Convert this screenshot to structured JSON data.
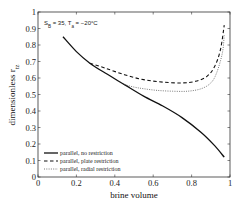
{
  "chart_data": {
    "type": "line",
    "title": "",
    "annotation": "S_B = 35, T_a = -20°C",
    "annotation_parts": {
      "s": "S",
      "s_sub": "B",
      "s_val": " = 35, T",
      "t_sub": "a",
      "t_val": " = −20°C"
    },
    "xlabel": "brine volume",
    "ylabel": "dimensionless r_tz",
    "ylabel_main": "dimensionless r",
    "ylabel_sub": "tz",
    "xlim": [
      0,
      1
    ],
    "ylim": [
      0,
      1
    ],
    "xticks": [
      "0",
      "0.2",
      "0.4",
      "0.6",
      "0.8",
      "1"
    ],
    "yticks": [
      "0",
      "0.1",
      "0.2",
      "0.3",
      "0.4",
      "0.5",
      "0.6",
      "0.7",
      "0.8",
      "0.9",
      "1"
    ],
    "grid": false,
    "legend_position": "lower left",
    "series": [
      {
        "name": "parallel, no restriction",
        "style": "solid",
        "x": [
          0.13,
          0.2,
          0.27,
          0.35,
          0.45,
          0.55,
          0.65,
          0.75,
          0.85,
          0.92,
          0.97
        ],
        "y": [
          0.85,
          0.76,
          0.69,
          0.63,
          0.56,
          0.49,
          0.43,
          0.36,
          0.27,
          0.19,
          0.12
        ]
      },
      {
        "name": "parallel, plate restriction",
        "style": "dashed",
        "x": [
          0.27,
          0.35,
          0.45,
          0.55,
          0.65,
          0.75,
          0.82,
          0.88,
          0.92,
          0.95,
          0.97
        ],
        "y": [
          0.69,
          0.66,
          0.62,
          0.59,
          0.575,
          0.57,
          0.58,
          0.61,
          0.67,
          0.77,
          0.92
        ]
      },
      {
        "name": "parallel, radial restriction",
        "style": "dotted",
        "x": [
          0.45,
          0.5,
          0.55,
          0.62,
          0.7,
          0.78,
          0.85,
          0.9,
          0.93,
          0.96,
          0.97
        ],
        "y": [
          0.56,
          0.545,
          0.535,
          0.525,
          0.52,
          0.52,
          0.535,
          0.57,
          0.63,
          0.75,
          0.86
        ]
      }
    ]
  }
}
